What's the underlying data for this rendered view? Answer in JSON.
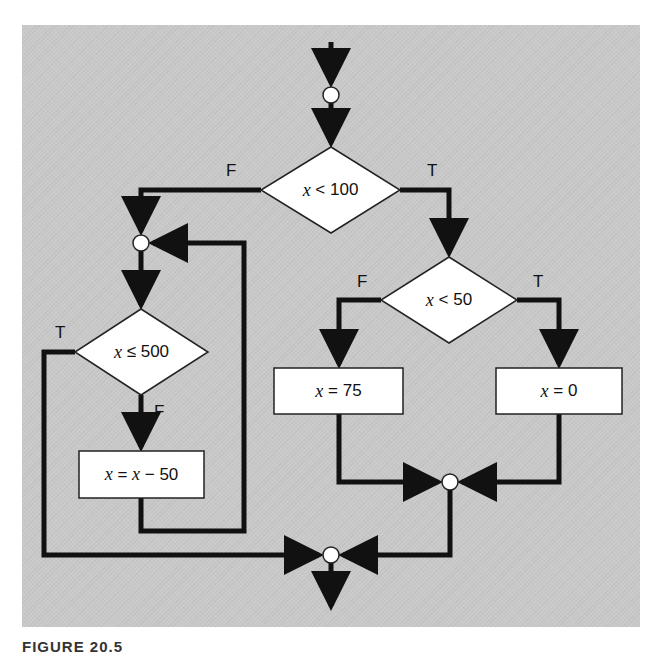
{
  "figure": {
    "caption": "FIGURE 20.5",
    "background_color": "#c9c9c9",
    "line_color": "#111111",
    "node_fill": "#ffffff"
  },
  "nodes": {
    "decision_top": {
      "var": "x",
      "op_value": "< 100",
      "true_label": "T",
      "false_label": "F"
    },
    "decision_mid": {
      "var": "x",
      "op_value": "< 50",
      "true_label": "T",
      "false_label": "F"
    },
    "decision_loop": {
      "var": "x",
      "op_value": "≤ 500",
      "true_label": "T",
      "false_label": "F"
    },
    "box_75": {
      "var": "x",
      "rhs": "= 75"
    },
    "box_0": {
      "var": "x",
      "rhs": "= 0"
    },
    "box_sub": {
      "var": "x",
      "mid": " = ",
      "var2": "x",
      "rhs": " − 50"
    }
  }
}
